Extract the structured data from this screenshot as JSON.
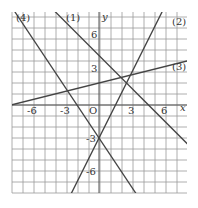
{
  "axes": {
    "x_label": "x",
    "y_label": "y",
    "origin_label": "O",
    "x_ticks": [
      "-6",
      "-3",
      "3",
      "6"
    ],
    "y_ticks": [
      "6",
      "3",
      "-3",
      "-6"
    ]
  },
  "lines": [
    {
      "label": "(1)",
      "slope": -1,
      "intercept": 4.5
    },
    {
      "label": "(2)",
      "slope": 2,
      "intercept": -3
    },
    {
      "label": "(3)",
      "slope": 0.25,
      "intercept": 2
    },
    {
      "label": "(4)",
      "slope": -1.5,
      "intercept": -3
    }
  ],
  "grid": {
    "xmin": -8,
    "xmax": 8,
    "ymin": -8,
    "ymax": 8.5,
    "unit": 1
  }
}
